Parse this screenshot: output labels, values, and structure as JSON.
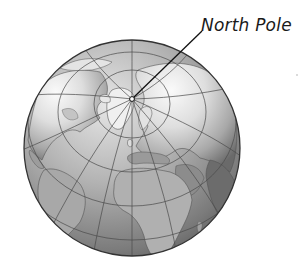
{
  "diagram": {
    "label": {
      "text": "North Pole"
    },
    "pole_marker": {
      "x": 132,
      "y": 99
    },
    "leader_line_end": {
      "x": 202,
      "y": 31
    },
    "globe": {
      "cx": 132,
      "cy": 148,
      "r": 108
    },
    "colors": {
      "ocean_light": "#d9d9d9",
      "ocean_dark": "#6e6e6e",
      "land_light": "#f2f2f2",
      "land_mid": "#b5b5b5",
      "land_dark": "#5a5a5a",
      "grid": "#4a4a4a",
      "outline": "#3a3a3a"
    }
  }
}
